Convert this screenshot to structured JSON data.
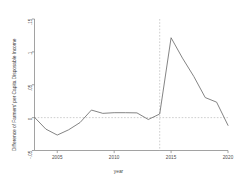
{
  "chart_data": {
    "type": "line",
    "title": "",
    "xlabel": "year",
    "ylabel": "Difference of Farmers' per Capita Disposable Income",
    "x": [
      2003,
      2004,
      2005,
      2006,
      2007,
      2008,
      2009,
      2010,
      2011,
      2012,
      2013,
      2014,
      2015,
      2016,
      2017,
      2018,
      2019,
      2020
    ],
    "values": [
      0.0005,
      -0.0175,
      -0.0265,
      -0.0185,
      -0.0075,
      0.0115,
      0.0065,
      0.0075,
      0.0075,
      0.0072,
      -0.0028,
      0.0055,
      0.1215,
      0.0905,
      0.0625,
      0.0305,
      0.0235,
      -0.0118
    ],
    "series": [
      {
        "name": "Difference of Farmers' per Capita Disposable Income",
        "values": [
          0.0005,
          -0.0175,
          -0.0265,
          -0.0185,
          -0.0075,
          0.0115,
          0.0065,
          0.0075,
          0.0075,
          0.0072,
          -0.0028,
          0.0055,
          0.1215,
          0.0905,
          0.0625,
          0.0305,
          0.0235,
          -0.0118
        ]
      }
    ],
    "xlim": [
      2003,
      2020
    ],
    "ylim": [
      -0.05,
      0.15
    ],
    "xticks": [
      2005,
      2010,
      2015,
      2020
    ],
    "xtick_labels": [
      "2005",
      "2010",
      "2015",
      "2020"
    ],
    "yticks": [
      -0.05,
      0,
      0.05,
      0.1,
      0.15
    ],
    "ytick_labels": [
      "-.05",
      "0",
      ".05",
      ".1",
      ".15"
    ],
    "grid": false,
    "legend": false,
    "reference_lines": [
      {
        "orientation": "horizontal",
        "value": 0,
        "style": "dashed",
        "color": "#b9b9b9"
      },
      {
        "orientation": "vertical",
        "value": 2014,
        "style": "dashed",
        "color": "#b9b9b9"
      }
    ],
    "line_color": "#6e6e6e",
    "axis_color": "#8a8a8a",
    "background": "#ffffff"
  }
}
